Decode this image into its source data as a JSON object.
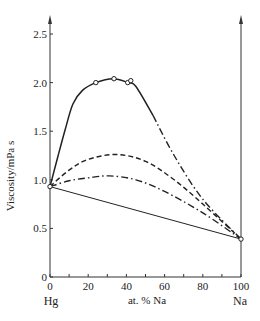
{
  "chart_data": {
    "type": "line",
    "title": "",
    "xlabel": "at. % Na",
    "ylabel": "Viscosity/mPa s",
    "x_end_labels": {
      "left": "Hg",
      "right": "Na"
    },
    "xlim": [
      0,
      100
    ],
    "ylim": [
      0,
      2.5
    ],
    "x_ticks": [
      0,
      20,
      40,
      60,
      80,
      100
    ],
    "x_minor_step": 10,
    "y_ticks": [
      0,
      0.5,
      1.0,
      1.5,
      2.0,
      2.5
    ],
    "y_tick_labels": [
      "0",
      "0.5",
      "1.0",
      "1.5",
      "2.0",
      "2.5"
    ],
    "grid": false,
    "legend": null,
    "series": [
      {
        "name": "measured (solid, with extrapolated dash-dot tail)",
        "style": "solid",
        "x": [
          0,
          4,
          8,
          12,
          17,
          24,
          33,
          41,
          45,
          54
        ],
        "y": [
          0.93,
          1.23,
          1.52,
          1.78,
          1.92,
          2.0,
          2.04,
          2.0,
          1.96,
          1.66
        ],
        "markers": [
          {
            "x": 0,
            "y": 0.93
          },
          {
            "x": 24,
            "y": 2.0
          },
          {
            "x": 33.5,
            "y": 2.04
          },
          {
            "x": 40.7,
            "y": 2.0
          },
          {
            "x": 42.3,
            "y": 2.02
          }
        ]
      },
      {
        "name": "extrapolated tail",
        "style": "dashdot",
        "x": [
          54,
          65,
          80,
          100
        ],
        "y": [
          1.66,
          1.25,
          0.8,
          0.39
        ]
      },
      {
        "name": "dashed model",
        "style": "dashed",
        "x": [
          0,
          10,
          20,
          35,
          50,
          65,
          80,
          100
        ],
        "y": [
          0.93,
          1.1,
          1.21,
          1.26,
          1.19,
          1.0,
          0.75,
          0.39
        ]
      },
      {
        "name": "dash-dot model",
        "style": "dashdot",
        "x": [
          0,
          10,
          20,
          31,
          45,
          60,
          80,
          100
        ],
        "y": [
          0.93,
          0.99,
          1.02,
          1.04,
          1.0,
          0.88,
          0.66,
          0.39
        ]
      },
      {
        "name": "linear (ideal)",
        "style": "solid-thin",
        "x": [
          0,
          100
        ],
        "y": [
          0.93,
          0.39
        ]
      }
    ],
    "endpoints": {
      "Hg": 0.93,
      "Na": 0.39
    }
  }
}
